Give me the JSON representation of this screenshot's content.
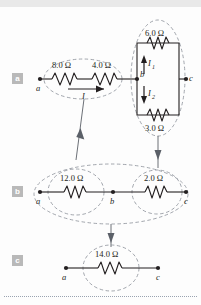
{
  "figure": {
    "panels": [
      {
        "tag": "a",
        "nodes": [
          "a",
          "b",
          "c"
        ],
        "resistors": [
          "8.0 Ω",
          "4.0 Ω",
          "6.0 Ω",
          "3.0 Ω"
        ],
        "currents": [
          "I",
          "I",
          "I"
        ]
      },
      {
        "tag": "b",
        "nodes": [
          "a",
          "b",
          "c"
        ],
        "resistors": [
          "12.0 Ω",
          "2.0 Ω"
        ]
      },
      {
        "tag": "c",
        "nodes": [
          "a",
          "c"
        ],
        "resistors": [
          "14.0 Ω"
        ]
      }
    ]
  },
  "panel_a": {
    "tag": "a",
    "node_a": "a",
    "node_b": "b",
    "node_c": "c",
    "r_8": "8.0 Ω",
    "r_4": "4.0 Ω",
    "r_6": "6.0 Ω",
    "r_3": "3.0 Ω",
    "current_I": "I",
    "current_I1": "I",
    "current_I1_sub": "1",
    "current_I2": "I",
    "current_I2_sub": "2"
  },
  "panel_b": {
    "tag": "b",
    "node_a": "a",
    "node_b": "b",
    "node_c": "c",
    "r_12": "12.0 Ω",
    "r_2": "2.0 Ω"
  },
  "panel_c": {
    "tag": "c",
    "node_a": "a",
    "node_c": "c",
    "r_14": "14.0 Ω"
  },
  "colors": {
    "wire": "#231f20",
    "dashed_group": "#8a8f98",
    "arrow": "#5b6068",
    "tag_background": "#b9b9b9",
    "tag_text": "#ffffff",
    "top_bar": "#e9e9e9",
    "bottom_rule": "#9aa3b0"
  }
}
